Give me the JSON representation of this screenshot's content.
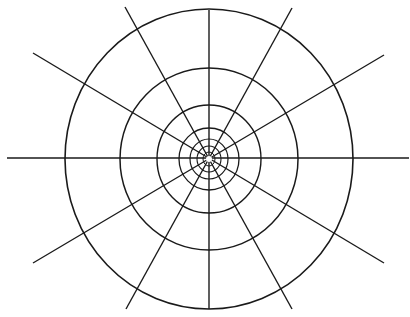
{
  "diagram": {
    "type": "polar-grid",
    "canvas": {
      "width": 410,
      "height": 317,
      "background": "#ffffff"
    },
    "stroke_color": "#1a1a1a",
    "center": {
      "x": 209,
      "y": 159
    },
    "rings": [
      {
        "rx": 144,
        "ry": 150,
        "stroke_width": 1.6
      },
      {
        "rx": 89,
        "ry": 91,
        "stroke_width": 1.5
      },
      {
        "rx": 52,
        "ry": 54,
        "stroke_width": 1.4
      },
      {
        "rx": 30,
        "ry": 31,
        "stroke_width": 1.3
      },
      {
        "rx": 19,
        "ry": 20,
        "stroke_width": 1.2
      },
      {
        "rx": 12,
        "ry": 13,
        "stroke_width": 1.1
      },
      {
        "rx": 6,
        "ry": 7,
        "stroke_width": 1.0
      }
    ],
    "rays": [
      {
        "x1": 7,
        "y1": 158,
        "x2": 409,
        "y2": 158
      },
      {
        "x1": 209,
        "y1": 10,
        "x2": 209,
        "y2": 309
      },
      {
        "x1": 125,
        "y1": 7,
        "x2": 292,
        "y2": 309
      },
      {
        "x1": 292,
        "y1": 8,
        "x2": 126,
        "y2": 309
      },
      {
        "x1": 33,
        "y1": 53,
        "x2": 384,
        "y2": 263
      },
      {
        "x1": 384,
        "y1": 55,
        "x2": 33,
        "y2": 263
      }
    ],
    "center_hole_radius": 3
  }
}
